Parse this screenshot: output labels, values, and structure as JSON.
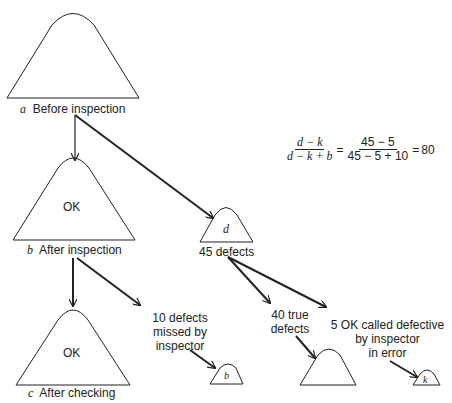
{
  "diagram": {
    "nodes": {
      "a": {
        "letter": "a",
        "caption": "Before inspection"
      },
      "b_after": {
        "letter": "b",
        "caption": "After inspection",
        "inner": "OK"
      },
      "c": {
        "letter": "c",
        "caption": "After checking",
        "inner": "OK"
      },
      "d": {
        "inner": "d",
        "caption": "45 defects"
      },
      "missed": {
        "line1": "10 defects",
        "line2": "missed by",
        "line3": "inspector",
        "inner": "b"
      },
      "true_def": {
        "line1": "40 true",
        "line2": "defects"
      },
      "k": {
        "line1": "5 OK called defective",
        "line2": "by inspector",
        "line3": "in error",
        "inner": "k"
      }
    },
    "formula": {
      "num1": "d − k",
      "den1": "d − k + b",
      "eq1": "=",
      "num2": "45 − 5",
      "den2": "45 − 5 + 10",
      "eq2": "=",
      "result": "80"
    }
  }
}
